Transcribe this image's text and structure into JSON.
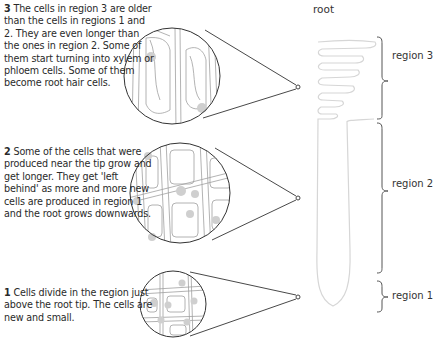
{
  "title": "root",
  "regions": [
    {
      "number": "1",
      "label": "region 1",
      "description": "Cells divide in the region just above the root tip. The cells are new and small."
    },
    {
      "number": "2",
      "label": "region 2",
      "description": "Some of the cells that were produced near the tip grow and get longer. They get 'left behind' as more and more new cells are produced in region 1 and the root grows downwards."
    },
    {
      "number": "3",
      "label": "region 3",
      "description": "The cells in region 3 are older than the cells in regions 1 and 2. They are even longer than the ones in region 2. Some of them start turning into xylem or phloem cells. Some of them become root hair cells."
    }
  ],
  "colors": {
    "outline": "#333333",
    "root_outline": "#d8d8d8",
    "cell_lines": "#9a9a9a",
    "nucleus": "#c8c8c8",
    "bracket": "#555555"
  }
}
